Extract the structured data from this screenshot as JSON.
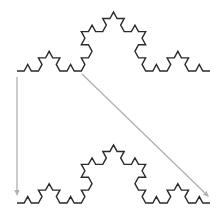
{
  "figure": {
    "background": "#ffffff",
    "curve_color": "#2a2a2a",
    "arrow_color": "#b0b0b0",
    "koch_order": 3,
    "curves": [
      {
        "name": "koch-curve-top",
        "start": [
          17,
          71
        ],
        "end": [
          210,
          71
        ],
        "peak_height": 59
      },
      {
        "name": "koch-curve-bottom",
        "start": [
          17,
          203
        ],
        "end": [
          210,
          203
        ],
        "peak_height": 58
      }
    ],
    "arrows": [
      {
        "name": "arrow-vertical",
        "from": [
          17,
          77
        ],
        "to": [
          17,
          196
        ]
      },
      {
        "name": "arrow-diagonal",
        "from": [
          82,
          74
        ],
        "to": [
          209,
          197
        ]
      }
    ]
  }
}
